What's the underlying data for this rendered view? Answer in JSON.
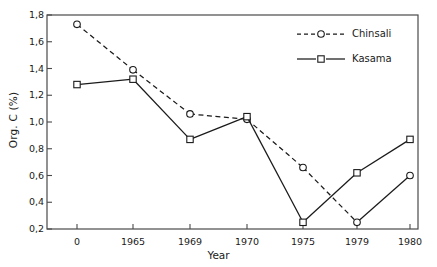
{
  "chart_data": {
    "type": "line",
    "title": "",
    "xlabel": "Year",
    "ylabel": "Org. C (%)",
    "categories": [
      "0",
      "1965",
      "1969",
      "1970",
      "1975",
      "1979",
      "1980"
    ],
    "ylim": [
      0.2,
      1.8
    ],
    "yticks": [
      "0,2",
      "0,4",
      "0,6",
      "0,8",
      "1,0",
      "1,2",
      "1,4",
      "1,6",
      "1,8"
    ],
    "ytick_values": [
      0.2,
      0.4,
      0.6,
      0.8,
      1.0,
      1.2,
      1.4,
      1.6,
      1.8
    ],
    "grid": false,
    "legend_position": "top-right",
    "decimal_separator": ",",
    "series": [
      {
        "name": "Chinsali",
        "marker": "circle-open",
        "linestyle": "dashed",
        "color": "#1a1a1a",
        "values": [
          1.73,
          1.39,
          1.06,
          1.02,
          0.66,
          0.25,
          0.6
        ]
      },
      {
        "name": "Kasama",
        "marker": "square-open",
        "linestyle": "solid",
        "color": "#1a1a1a",
        "values": [
          1.28,
          1.32,
          0.87,
          1.04,
          0.25,
          0.62,
          0.87
        ]
      }
    ]
  },
  "legend": {
    "items": [
      {
        "label": "Chinsali"
      },
      {
        "label": "Kasama"
      }
    ]
  },
  "axes": {
    "x_title": "Year",
    "y_title": "Org. C (%)"
  }
}
